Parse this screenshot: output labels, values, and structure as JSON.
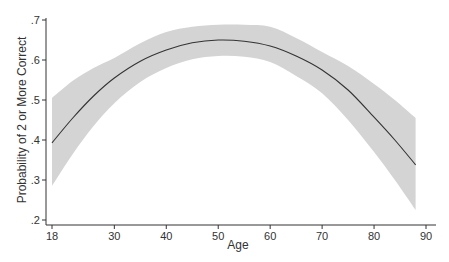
{
  "chart_data": {
    "type": "line",
    "title": "",
    "xlabel": "Age",
    "ylabel": "Probability of 2 or More Correct",
    "xlim": [
      18,
      90
    ],
    "ylim": [
      0.2,
      0.7
    ],
    "x_ticks": [
      18,
      30,
      40,
      50,
      60,
      70,
      80,
      90
    ],
    "x_tick_labels": [
      "18",
      "30",
      "40",
      "50",
      "60",
      "70",
      "80",
      "90"
    ],
    "y_ticks": [
      0.2,
      0.3,
      0.4,
      0.5,
      0.6,
      0.7
    ],
    "y_tick_labels": [
      ".2",
      ".3",
      ".4",
      ".5",
      ".6",
      ".7"
    ],
    "grid": false,
    "legend": null,
    "series": [
      {
        "name": "Predicted probability",
        "x": [
          18,
          22,
          26,
          30,
          35,
          40,
          45,
          50,
          55,
          60,
          65,
          70,
          75,
          80,
          84,
          88
        ],
        "values": [
          0.393,
          0.455,
          0.51,
          0.555,
          0.597,
          0.625,
          0.643,
          0.65,
          0.647,
          0.635,
          0.61,
          0.575,
          0.525,
          0.457,
          0.4,
          0.338
        ],
        "lower": [
          0.285,
          0.365,
          0.435,
          0.492,
          0.545,
          0.58,
          0.602,
          0.61,
          0.608,
          0.595,
          0.56,
          0.517,
          0.45,
          0.37,
          0.3,
          0.225
        ],
        "upper": [
          0.505,
          0.548,
          0.58,
          0.605,
          0.642,
          0.67,
          0.683,
          0.688,
          0.688,
          0.683,
          0.655,
          0.62,
          0.585,
          0.54,
          0.5,
          0.455
        ]
      }
    ],
    "colors": {
      "line": "#333333",
      "band": "#d4d4d4",
      "axis": "#333333"
    }
  }
}
